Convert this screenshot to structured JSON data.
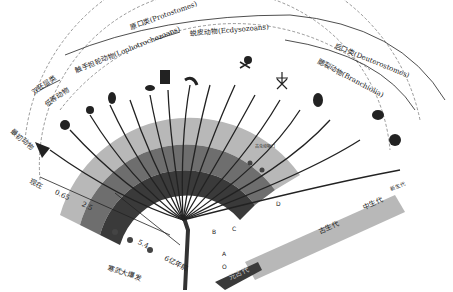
{
  "diagram": {
    "type": "phylogenetic-fan",
    "clades": {
      "protostomes": "原口类(Protostomes)",
      "ecdysozoans": "蜕皮动物(Ecdysozoans)",
      "lophotrochozoans": "触手担轮动物(Lophotrochozoans)",
      "deuterostomes": "后口类(Deuterostomes)",
      "branchiolia": "腮裂动物(Branchiolia)",
      "diploblastica": "双胚层类",
      "lower_animals": "低等动物",
      "basal": "最初动物"
    },
    "fossil_label": "古虫动物门",
    "eras": {
      "proterozoic": "元古代",
      "paleozoic": "古生代",
      "mesozoic": "中生代",
      "cenozoic": "新生代"
    },
    "time_axis": {
      "now": "现在",
      "t1": "0.65",
      "t2": "2.5",
      "t3": "5.4",
      "start": "6亿年前",
      "event": "寒武大爆发"
    },
    "nodes": [
      "O",
      "A",
      "B",
      "C",
      "D"
    ],
    "colors": {
      "dark_band": "#3a3a3a",
      "mid_band": "#6e6e6e",
      "light_band": "#b8b8b8",
      "branch": "#222222"
    }
  }
}
